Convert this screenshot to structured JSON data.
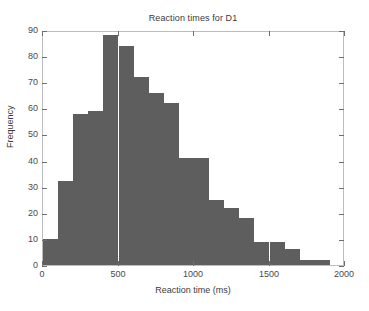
{
  "chart_data": {
    "type": "bar",
    "title": "Reaction times for D1",
    "xlabel": "Reaction time (ms)",
    "ylabel": "Frequency",
    "xlim": [
      0,
      2000
    ],
    "ylim": [
      0,
      90
    ],
    "grid": false,
    "legend": null,
    "bar_color": "#5e5e5e",
    "bin_width": 100,
    "x_ticks": [
      0,
      500,
      1000,
      1500,
      2000
    ],
    "x_tick_labels": [
      "0",
      "500",
      "1000",
      "1500",
      "2000"
    ],
    "y_ticks": [
      0,
      10,
      20,
      30,
      40,
      50,
      60,
      70,
      80,
      90
    ],
    "y_tick_labels": [
      "0",
      "10",
      "20",
      "30",
      "40",
      "50",
      "60",
      "70",
      "80",
      "90"
    ],
    "bins": [
      {
        "start": 0,
        "end": 100,
        "value": 10
      },
      {
        "start": 100,
        "end": 200,
        "value": 32
      },
      {
        "start": 200,
        "end": 300,
        "value": 58
      },
      {
        "start": 300,
        "end": 400,
        "value": 59
      },
      {
        "start": 400,
        "end": 500,
        "value": 88
      },
      {
        "start": 500,
        "end": 600,
        "value": 84
      },
      {
        "start": 600,
        "end": 700,
        "value": 72
      },
      {
        "start": 700,
        "end": 800,
        "value": 66
      },
      {
        "start": 800,
        "end": 900,
        "value": 62
      },
      {
        "start": 900,
        "end": 1000,
        "value": 41
      },
      {
        "start": 1000,
        "end": 1100,
        "value": 41
      },
      {
        "start": 1100,
        "end": 1200,
        "value": 25
      },
      {
        "start": 1200,
        "end": 1300,
        "value": 22
      },
      {
        "start": 1300,
        "end": 1400,
        "value": 18
      },
      {
        "start": 1400,
        "end": 1500,
        "value": 9
      },
      {
        "start": 1500,
        "end": 1600,
        "value": 9
      },
      {
        "start": 1600,
        "end": 1700,
        "value": 6
      },
      {
        "start": 1700,
        "end": 1800,
        "value": 2
      },
      {
        "start": 1800,
        "end": 1900,
        "value": 2
      }
    ],
    "categories": [
      "0-100",
      "100-200",
      "200-300",
      "300-400",
      "400-500",
      "500-600",
      "600-700",
      "700-800",
      "800-900",
      "900-1000",
      "1000-1100",
      "1100-1200",
      "1200-1300",
      "1300-1400",
      "1400-1500",
      "1500-1600",
      "1600-1700",
      "1700-1800",
      "1800-1900"
    ],
    "values": [
      10,
      32,
      58,
      59,
      88,
      84,
      72,
      66,
      62,
      41,
      41,
      25,
      22,
      18,
      9,
      9,
      6,
      2,
      2
    ]
  }
}
